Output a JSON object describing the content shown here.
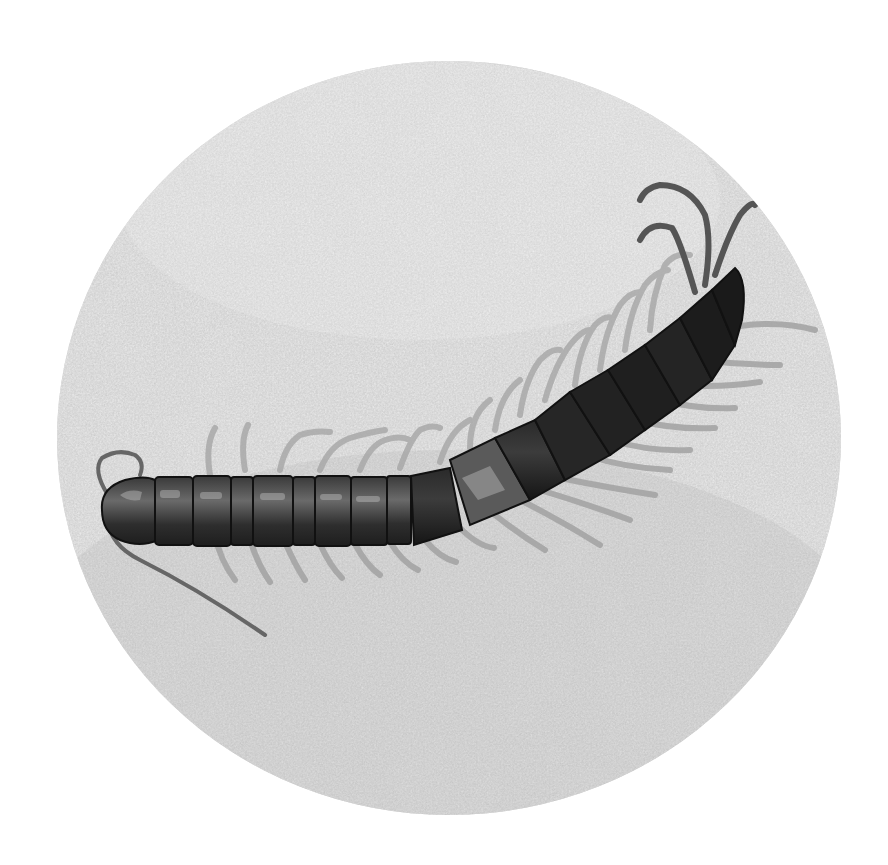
{
  "image": {
    "subject": "centipede on sand",
    "style": "grayscale photograph cropped to circle",
    "background_color": "#ffffff",
    "sand_color": "#d6d6d6",
    "body_dark_color": "#2a2a2a",
    "body_mid_color": "#5a5a5a",
    "leg_color": "#9a9a9a"
  }
}
